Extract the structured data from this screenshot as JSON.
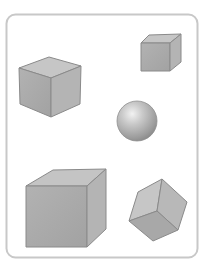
{
  "figure": {
    "frame": {
      "stroke": "#c8c8c8",
      "fill": "#ffffff"
    },
    "colors": {
      "face_front": "#a9a9a9",
      "face_top": "#c4c4c4",
      "face_side": "#b5b5b5",
      "edge": "#8a8a8a"
    },
    "shapes": [
      {
        "name": "cube-medium-left",
        "type": "cube"
      },
      {
        "name": "cube-small-top-right",
        "type": "cube"
      },
      {
        "name": "sphere",
        "type": "sphere"
      },
      {
        "name": "cube-large-bottom-left",
        "type": "cube"
      },
      {
        "name": "cube-rotated-bottom-right",
        "type": "cube"
      }
    ]
  }
}
